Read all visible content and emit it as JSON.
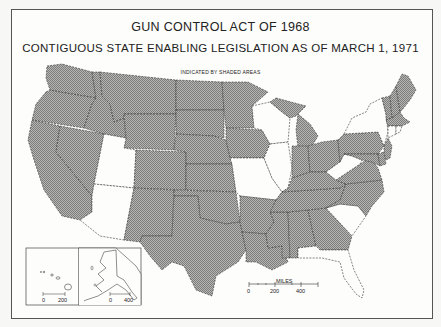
{
  "title": {
    "line1": "GUN CONTROL ACT OF 1968",
    "line2": "CONTIGUOUS STATE ENABLING LEGISLATION AS OF MARCH 1, 1971",
    "legend_note": "INDICATED BY SHADED AREAS"
  },
  "legend": {
    "shaded_meaning": "State enabling legislation enacted",
    "shaded_color": "#9a9a9a",
    "unshaded_color": "#fdfdfb"
  },
  "map": {
    "shaded_states": [
      "WA",
      "OR",
      "CA",
      "NV",
      "ID",
      "MT",
      "WY",
      "CO",
      "NM",
      "ND",
      "SD",
      "NE",
      "KS",
      "OK",
      "TX",
      "MN",
      "IA",
      "AR",
      "LA",
      "MS",
      "AL",
      "GA",
      "TN",
      "KY",
      "IN",
      "OH",
      "MI",
      "PA",
      "NJ",
      "DE",
      "MD",
      "VA",
      "NC",
      "ME",
      "NH",
      "VT",
      "MA"
    ],
    "unshaded_states": [
      "UT",
      "AZ",
      "WI",
      "IL",
      "MO",
      "WV",
      "NY",
      "SC",
      "FL",
      "CT",
      "RI"
    ]
  },
  "scale_bar": {
    "unit": "MILES",
    "ticks": [
      "0",
      "200",
      "400"
    ]
  },
  "inset_hawaii": {
    "ticks": [
      "0",
      "200"
    ]
  },
  "inset_alaska": {
    "ticks": [
      "0",
      "400"
    ]
  }
}
